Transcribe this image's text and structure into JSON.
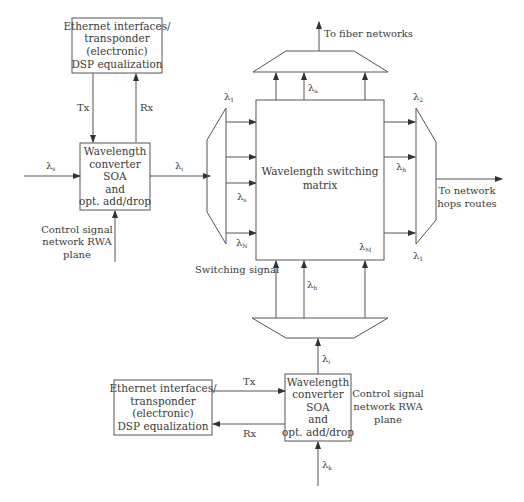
{
  "diagram": {
    "colors": {
      "line": "#555555",
      "text": "#3a3a3a",
      "background": "#ffffff"
    },
    "top_ethernet_box": {
      "lines": [
        "Ethernet interfaces/",
        "transponder",
        "(electronic)",
        "DSP equalization"
      ]
    },
    "top_tx_label": "Tx",
    "top_rx_label": "Rx",
    "left_converter_box": {
      "lines": [
        "Wavelength",
        "converter",
        "SOA",
        "and",
        "opt. add/drop"
      ]
    },
    "left_input_lambda": {
      "symbol": "λ",
      "sub": "s"
    },
    "left_output_lambda": {
      "symbol": "λ",
      "sub": "i"
    },
    "left_control_label": [
      "Control signal",
      "network RWA",
      "plane"
    ],
    "input_demux": {
      "top_lambda": {
        "symbol": "λ",
        "sub": "1"
      },
      "mid_lambda": {
        "symbol": "λ",
        "sub": "s"
      },
      "bottom_lambda": {
        "symbol": "λ",
        "sub": "N"
      }
    },
    "switch_matrix": {
      "lines": [
        "Wavelength switching",
        "matrix"
      ]
    },
    "matrix_corner_lambda": {
      "symbol": "λ",
      "sub": "M"
    },
    "top_mux": {
      "output_label": "To fiber networks",
      "lambda": {
        "symbol": "λ",
        "sub": "a"
      }
    },
    "output_mux": {
      "top_lambda": {
        "symbol": "λ",
        "sub": "2"
      },
      "mid_lambda": {
        "symbol": "λ",
        "sub": "h"
      },
      "bottom_lambda": {
        "symbol": "λ",
        "sub": "1"
      },
      "output_label": [
        "To network",
        "hops routes"
      ]
    },
    "switching_signal_label": "Switching signal",
    "bottom_mux": {
      "lambda": {
        "symbol": "λ",
        "sub": "h"
      }
    },
    "bottom_converter_box": {
      "lines": [
        "Wavelength",
        "converter",
        "SOA",
        "and",
        "opt. add/drop"
      ]
    },
    "bottom_output_lambda": {
      "symbol": "λ",
      "sub": "i"
    },
    "bottom_input_lambda": {
      "symbol": "λ",
      "sub": "k"
    },
    "bottom_ethernet_box": {
      "lines": [
        "Ethernet interfaces/",
        "transponder",
        "(electronic)",
        "DSP equalization"
      ]
    },
    "bottom_tx_label": "Tx",
    "bottom_rx_label": "Rx",
    "bottom_control_label": [
      "Control signal",
      "network RWA",
      "plane"
    ]
  }
}
